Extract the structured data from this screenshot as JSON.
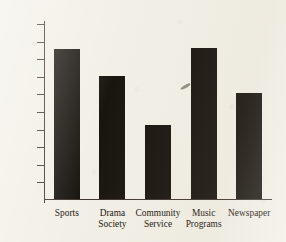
{
  "chart_data": {
    "type": "bar",
    "title": "",
    "subtitle": "",
    "xlabel": "",
    "ylabel": "",
    "categories": [
      "Sports",
      "Drama Society",
      "Community Service",
      "Music Programs",
      "Newspaper"
    ],
    "category_lines": [
      [
        "Sports",
        ""
      ],
      [
        "Drama",
        "Society"
      ],
      [
        "Community",
        "Service"
      ],
      [
        "Music",
        "Programs"
      ],
      [
        "Newspaper",
        ""
      ]
    ],
    "values": [
      8500,
      7000,
      4200,
      8600,
      6000
    ],
    "ylim": [
      0,
      10000
    ],
    "ytick_values": [
      10000,
      9000,
      8000,
      7000,
      6000,
      5000,
      4000,
      3000,
      2000,
      1000
    ],
    "ytick_labels": [
      "10,000",
      "9,000",
      "8,000",
      "7,000",
      "6,000",
      "5,000",
      "4,000",
      "3,000",
      "2,000",
      "1,000"
    ],
    "grid": false,
    "legend": null,
    "legend_position": "none",
    "bar_color": "#19150f",
    "axis_color": "#40382f",
    "background_color": "#f2efe6"
  }
}
